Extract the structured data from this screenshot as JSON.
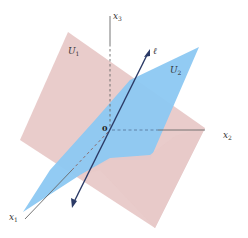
{
  "figure": {
    "type": "3d-subspaces-diagram",
    "axes": {
      "x1": {
        "label": "x",
        "sub": "1"
      },
      "x2": {
        "label": "x",
        "sub": "2"
      },
      "x3": {
        "label": "x",
        "sub": "3"
      }
    },
    "origin_label": "0",
    "planes": [
      {
        "name": "U1",
        "label": "U",
        "sub": "1",
        "color": "#e8c9c8"
      },
      {
        "name": "U2",
        "label": "U",
        "sub": "2",
        "color": "#8cc8f2"
      }
    ],
    "line": {
      "label": "ℓ",
      "color": "#2b3a66"
    },
    "axis_color": "#666666"
  }
}
